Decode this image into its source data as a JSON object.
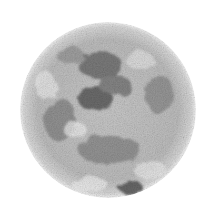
{
  "image": {
    "subject": "Moon",
    "description": "Grayscale textured sphere resembling the full moon on a white background",
    "background_color": "#ffffff",
    "surface_colors": {
      "highlight": "#f2f2f2",
      "mid": "#b5b5b5",
      "dark": "#6e6e6e",
      "shadow": "#4a4a4a"
    }
  }
}
